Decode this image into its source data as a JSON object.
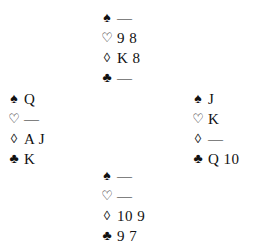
{
  "deal": {
    "north": {
      "spades": "—",
      "hearts": "9 8",
      "diamonds": "K 8",
      "clubs": "—"
    },
    "west": {
      "spades": "Q",
      "hearts": "—",
      "diamonds": "A J",
      "clubs": "K"
    },
    "east": {
      "spades": "J",
      "hearts": "K",
      "diamonds": "—",
      "clubs": "Q 10"
    },
    "south": {
      "spades": "—",
      "hearts": "—",
      "diamonds": "10 9",
      "clubs": "9 7"
    }
  },
  "symbols": {
    "spade": "♠",
    "heart": "♡",
    "diamond": "◊",
    "club": "♣"
  }
}
